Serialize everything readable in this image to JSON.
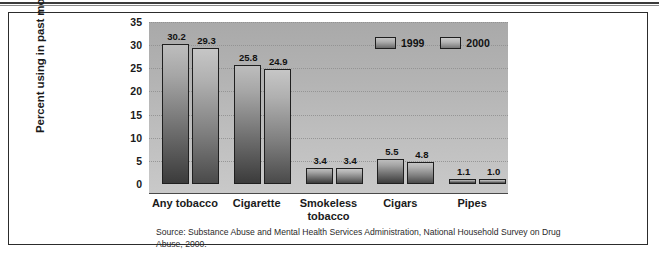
{
  "figure": {
    "source_note": "Source: Substance Abuse and Mental Health Services Administration, National Household Survey on Drug Abuse, 2000."
  },
  "chart_data": {
    "type": "bar",
    "title": "",
    "xlabel": "",
    "ylabel": "Percent using in past month",
    "ylim": [
      0,
      35
    ],
    "ytick_step": 5,
    "yticks": [
      "35",
      "30",
      "25",
      "20",
      "15",
      "10",
      "5",
      "0"
    ],
    "grid": true,
    "grid_style": "dotted-horizontal",
    "legend_position": "top-right",
    "categories": [
      "Any tobacco",
      "Cigarette",
      "Smokeless tobacco",
      "Cigars",
      "Pipes"
    ],
    "series": [
      {
        "name": "1999",
        "color": "#8a8a8a",
        "values": [
          30.2,
          25.8,
          3.4,
          5.5,
          1.1
        ],
        "labels": [
          "30.2",
          "25.8",
          "3.4",
          "5.5",
          "1.1"
        ]
      },
      {
        "name": "2000",
        "color": "#9c9c9c",
        "values": [
          29.3,
          24.9,
          3.4,
          4.8,
          1.0
        ],
        "labels": [
          "29.3",
          "24.9",
          "3.4",
          "4.8",
          "1.0"
        ]
      }
    ]
  }
}
